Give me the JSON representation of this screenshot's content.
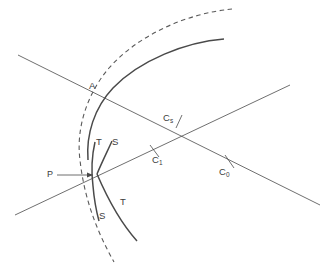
{
  "figure": {
    "stroke_color": "#4a4a4a",
    "label_color": "#3c3c3c",
    "background": "#ffffff",
    "width": 329,
    "height": 271
  },
  "labels": {
    "point_a": "A",
    "point_p": "P",
    "tangent_upper": "T",
    "sagittal_upper": "S",
    "sagittal_lower": "S",
    "tangent_lower": "T",
    "c_s_main": "C",
    "c_s_sub": "s",
    "c_1_main": "C",
    "c_1_sub": "1",
    "c_0_main": "C",
    "c_0_sub": "0"
  },
  "elements": {
    "dashed_arc": "dashed-circular-arc",
    "solid_arc": "solid-wavefront-arc",
    "cusp_curve_upper": "cusp-branch-upper",
    "cusp_curve_lower": "cusp-branch-lower",
    "cusp_curve_inner": "cusp-branch-inner",
    "line_descending": "straight-line-descending",
    "line_ascending": "straight-line-ascending",
    "pointer_arrow": "p-pointer-arrow",
    "tick_cs": "tick-mark-cs",
    "tick_c1": "tick-mark-c1",
    "tick_c0": "tick-mark-c0"
  }
}
